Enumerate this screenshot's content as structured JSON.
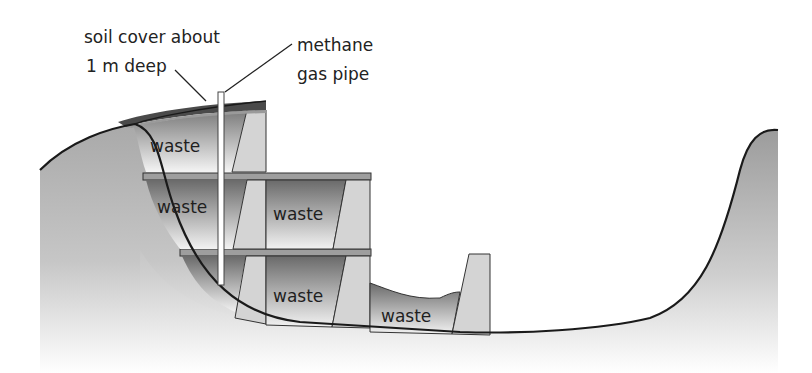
{
  "diagram": {
    "labels": {
      "soil_cover_line1": "soil cover about",
      "soil_cover_line2": "1 m deep",
      "methane_line1": "methane",
      "methane_line2": "gas pipe"
    },
    "cells": [
      {
        "id": "top-left",
        "label": "waste"
      },
      {
        "id": "mid-left",
        "label": "waste"
      },
      {
        "id": "mid-right",
        "label": "waste"
      },
      {
        "id": "bottom-right",
        "label": "waste"
      },
      {
        "id": "pit",
        "label": "waste"
      }
    ],
    "colors": {
      "ground": "#b5b5b5",
      "waste_dark": "#6e6e6e",
      "waste_light": "#efefef",
      "wall": "#d2d2d2",
      "cover": "#555555",
      "outline": "#1a1a1a"
    }
  }
}
